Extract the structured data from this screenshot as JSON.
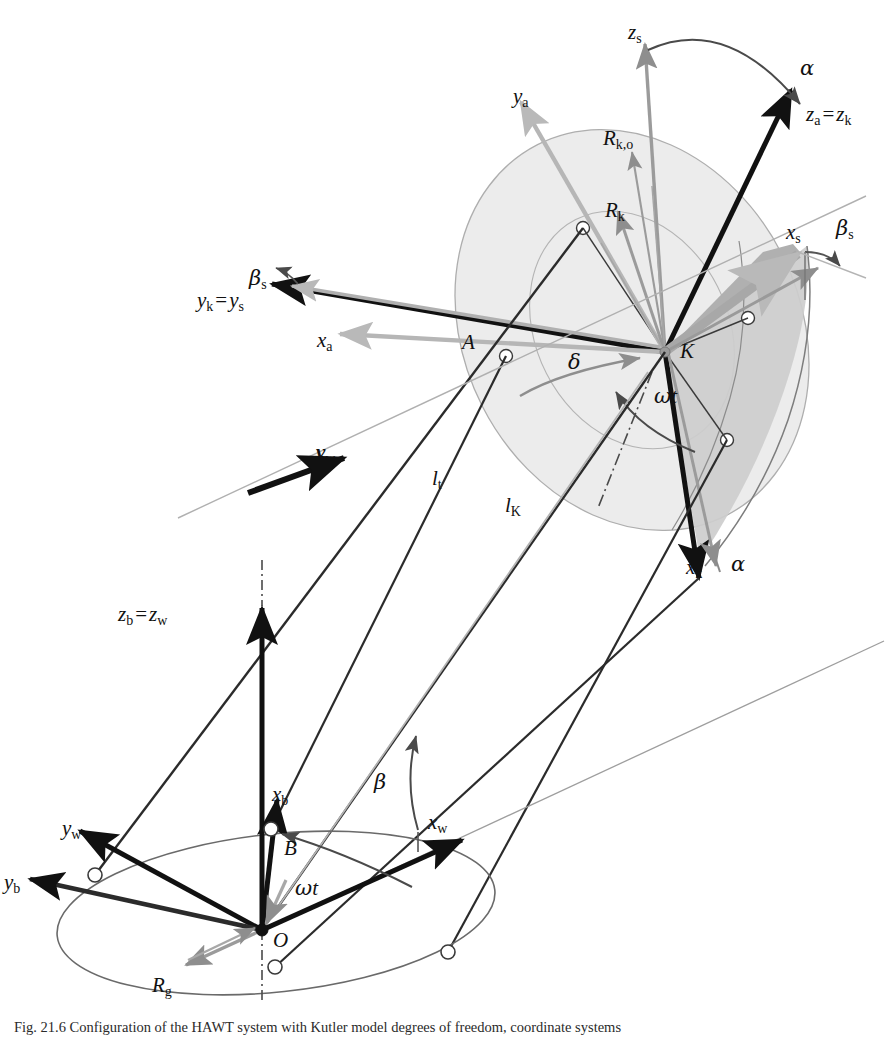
{
  "figure": {
    "domain": "Diagram",
    "caption_prefix": "Fig. 21.6",
    "caption_text": "Fig. 21.6  Configuration of the HAWT system with Kutler model degrees of freedom, coordinate systems",
    "background": "#ffffff"
  },
  "colors": {
    "black": "#111111",
    "dark_line": "#2b2b2b",
    "mid_gray": "#8e8e8e",
    "light_gray": "#b9b9b9",
    "disc_fill": "#e9e9e9",
    "sector_fill": "#cfcfcf",
    "disc_stroke": "#a9a9a9",
    "node_fill": "#ffffff",
    "node_stroke": "#3a3a3a"
  },
  "labels": [
    {
      "id": "z-s",
      "base": "z",
      "sub": "s",
      "kind": "italic",
      "x": 628,
      "y": 22,
      "color": "#111111"
    },
    {
      "id": "alpha-top",
      "base": "α",
      "sub": "",
      "kind": "greek",
      "x": 800,
      "y": 58,
      "color": "#111111"
    },
    {
      "id": "z-a-z-k",
      "base": "z",
      "sub": "a",
      "kind": "italic",
      "x": 806,
      "y": 104,
      "color": "#111111",
      "eq_base": "z",
      "eq_sub": "k"
    },
    {
      "id": "y-a",
      "base": "y",
      "sub": "a",
      "kind": "italic",
      "x": 513,
      "y": 86,
      "color": "#111111"
    },
    {
      "id": "R-k-o",
      "base": "R",
      "sub": "k,o",
      "kind": "italic",
      "x": 603,
      "y": 128,
      "color": "#111111"
    },
    {
      "id": "R-k",
      "base": "R",
      "sub": "k",
      "kind": "italic",
      "x": 605,
      "y": 200,
      "color": "#111111"
    },
    {
      "id": "x-s",
      "base": "x",
      "sub": "s",
      "kind": "italic",
      "x": 786,
      "y": 222,
      "color": "#111111"
    },
    {
      "id": "beta-s-r",
      "base": "β",
      "sub": "s",
      "kind": "greek",
      "x": 836,
      "y": 218,
      "color": "#111111"
    },
    {
      "id": "beta-s-l",
      "base": "β",
      "sub": "s",
      "kind": "greek",
      "x": 249,
      "y": 268,
      "color": "#111111"
    },
    {
      "id": "y-k-y-s",
      "base": "y",
      "sub": "k",
      "kind": "italic",
      "x": 197,
      "y": 290,
      "color": "#111111",
      "eq_base": "y",
      "eq_sub": "s"
    },
    {
      "id": "x-a",
      "base": "x",
      "sub": "a",
      "kind": "italic",
      "x": 317,
      "y": 330,
      "color": "#111111"
    },
    {
      "id": "A-node",
      "base": "A",
      "sub": "",
      "kind": "italic",
      "x": 462,
      "y": 332,
      "color": "#111111"
    },
    {
      "id": "K-node",
      "base": "K",
      "sub": "",
      "kind": "italic",
      "x": 680,
      "y": 341,
      "color": "#111111"
    },
    {
      "id": "delta",
      "base": "δ",
      "sub": "",
      "kind": "greek",
      "x": 568,
      "y": 352,
      "color": "#111111"
    },
    {
      "id": "omega-t-k",
      "base": "ω",
      "sub": "",
      "kind": "greek",
      "x": 654,
      "y": 386,
      "color": "#111111",
      "italic_suffix": "t"
    },
    {
      "id": "v-w",
      "base": "v",
      "sub": "w",
      "kind": "bold",
      "x": 316,
      "y": 442,
      "color": "#111111"
    },
    {
      "id": "l-t",
      "base": "l",
      "sub": "t",
      "kind": "italic",
      "x": 432,
      "y": 468,
      "color": "#111111"
    },
    {
      "id": "l-K",
      "base": "l",
      "sub": "K",
      "kind": "italic",
      "x": 505,
      "y": 495,
      "color": "#111111"
    },
    {
      "id": "x-k",
      "base": "x",
      "sub": "k",
      "kind": "italic",
      "x": 686,
      "y": 557,
      "color": "#111111"
    },
    {
      "id": "alpha-bot",
      "base": "α",
      "sub": "",
      "kind": "greek",
      "x": 731,
      "y": 554,
      "color": "#111111"
    },
    {
      "id": "z-b-z-w",
      "base": "z",
      "sub": "b",
      "kind": "italic",
      "x": 118,
      "y": 604,
      "color": "#111111",
      "eq_base": "z",
      "eq_sub": "w"
    },
    {
      "id": "beta",
      "base": "β",
      "sub": "",
      "kind": "greek",
      "x": 374,
      "y": 772,
      "color": "#111111"
    },
    {
      "id": "x-b",
      "base": "x",
      "sub": "b",
      "kind": "italic",
      "x": 272,
      "y": 784,
      "color": "#111111"
    },
    {
      "id": "x-w",
      "base": "x",
      "sub": "w",
      "kind": "italic",
      "x": 428,
      "y": 812,
      "color": "#111111"
    },
    {
      "id": "y-w",
      "base": "y",
      "sub": "w",
      "kind": "italic",
      "x": 62,
      "y": 818,
      "color": "#111111"
    },
    {
      "id": "B-node",
      "base": "B",
      "sub": "",
      "kind": "italic",
      "x": 284,
      "y": 838,
      "color": "#111111"
    },
    {
      "id": "y-b",
      "base": "y",
      "sub": "b",
      "kind": "italic",
      "x": 4,
      "y": 872,
      "color": "#111111"
    },
    {
      "id": "omega-t-o",
      "base": "ω",
      "sub": "",
      "kind": "greek",
      "x": 295,
      "y": 878,
      "color": "#111111",
      "italic_suffix": "t"
    },
    {
      "id": "O-node",
      "base": "O",
      "sub": "",
      "kind": "italic",
      "x": 273,
      "y": 930,
      "color": "#111111"
    },
    {
      "id": "R-g",
      "base": "R",
      "sub": "g",
      "kind": "italic",
      "x": 152,
      "y": 975,
      "color": "#111111"
    }
  ],
  "geometry": {
    "hub_K": {
      "x": 665,
      "y": 352,
      "label": "K"
    },
    "origin_O": {
      "x": 262,
      "y": 930,
      "label": "O"
    },
    "node_A": {
      "x": 506,
      "y": 356,
      "label": "A"
    },
    "node_B": {
      "x": 271,
      "y": 829,
      "label": "B"
    },
    "tower_top": {
      "x": 262,
      "y": 604
    },
    "rotor_disc": {
      "cx": 640,
      "cy": 330,
      "rx": 165,
      "ry": 205,
      "rotation": -28
    },
    "ground_ellipse": {
      "cx": 275,
      "cy": 915,
      "rx": 218,
      "ry": 78,
      "rotation": -6
    }
  },
  "vectors": [
    {
      "name": "z_s",
      "color": "mid_gray",
      "from": [
        665,
        352
      ],
      "to": [
        644,
        40
      ],
      "weight": 3
    },
    {
      "name": "z_a_z_k",
      "color": "black",
      "from": [
        665,
        352
      ],
      "to": [
        793,
        88
      ],
      "weight": 5
    },
    {
      "name": "y_a",
      "color": "light_gray",
      "from": [
        665,
        352
      ],
      "to": [
        520,
        100
      ],
      "weight": 4
    },
    {
      "name": "y_k_y_s",
      "color": "black",
      "from": [
        665,
        352
      ],
      "to": [
        269,
        282
      ],
      "weight": 5
    },
    {
      "name": "x_a",
      "color": "light_gray",
      "from": [
        665,
        352
      ],
      "to": [
        336,
        332
      ],
      "weight": 4
    },
    {
      "name": "x_s",
      "color": "mid_gray",
      "from": [
        665,
        352
      ],
      "to": [
        802,
        250
      ],
      "weight": 10
    },
    {
      "name": "x_k",
      "color": "black",
      "from": [
        665,
        352
      ],
      "to": [
        700,
        580
      ],
      "weight": 5
    },
    {
      "name": "R_k",
      "color": "mid_gray",
      "from": [
        665,
        352
      ],
      "to": [
        620,
        215
      ],
      "weight": 3
    },
    {
      "name": "R_k_o",
      "color": "mid_gray",
      "from": [
        665,
        352
      ],
      "to": [
        633,
        155
      ],
      "weight": 2
    },
    {
      "name": "z_b_z_w",
      "color": "black",
      "from": [
        262,
        930
      ],
      "to": [
        262,
        604
      ],
      "weight": 5
    },
    {
      "name": "x_b",
      "color": "black",
      "from": [
        262,
        930
      ],
      "to": [
        276,
        797
      ],
      "weight": 5
    },
    {
      "name": "x_w",
      "color": "black",
      "from": [
        262,
        930
      ],
      "to": [
        465,
        838
      ],
      "weight": 5
    },
    {
      "name": "y_w",
      "color": "black",
      "from": [
        262,
        930
      ],
      "to": [
        78,
        829
      ],
      "weight": 5
    },
    {
      "name": "y_b",
      "color": "black",
      "from": [
        262,
        930
      ],
      "to": [
        28,
        879
      ],
      "weight": 5
    },
    {
      "name": "R_g",
      "color": "mid_gray",
      "from": [
        262,
        930
      ],
      "to": [
        182,
        962
      ],
      "weight": 3
    },
    {
      "name": "v_w",
      "color": "black",
      "from": [
        249,
        492
      ],
      "to": [
        346,
        457
      ],
      "weight": 6
    }
  ],
  "angle_arcs": [
    {
      "name": "alpha_top",
      "label": "α"
    },
    {
      "name": "alpha_bot",
      "label": "α"
    },
    {
      "name": "beta_s_left",
      "label": "β_s"
    },
    {
      "name": "beta_s_right",
      "label": "β_s"
    },
    {
      "name": "delta",
      "label": "δ"
    },
    {
      "name": "omega_t_hub",
      "label": "ωt"
    },
    {
      "name": "omega_t_origin",
      "label": "ωt"
    },
    {
      "name": "beta_tilt",
      "label": "β"
    }
  ]
}
